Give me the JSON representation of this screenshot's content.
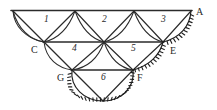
{
  "figure": {
    "type": "triangulation-survey-diagram",
    "background_color": "#ffffff",
    "ink_color": "#2b2b2b",
    "width": 217,
    "height": 110
  },
  "vertex_labels": [
    {
      "id": "A",
      "text": "A",
      "x": 196,
      "y": 7
    },
    {
      "id": "C",
      "text": "C",
      "x": 31,
      "y": 45
    },
    {
      "id": "E",
      "text": "E",
      "x": 170,
      "y": 46
    },
    {
      "id": "G",
      "text": "G",
      "x": 57,
      "y": 73
    },
    {
      "id": "F",
      "text": "F",
      "x": 137,
      "y": 73
    }
  ],
  "region_labels": [
    {
      "id": "1",
      "text": "1",
      "x": 44,
      "y": 15
    },
    {
      "id": "2",
      "text": "2",
      "x": 102,
      "y": 15
    },
    {
      "id": "3",
      "text": "3",
      "x": 161,
      "y": 15
    },
    {
      "id": "4",
      "text": "4",
      "x": 72,
      "y": 44
    },
    {
      "id": "5",
      "text": "5",
      "x": 131,
      "y": 44
    },
    {
      "id": "6",
      "text": "6",
      "x": 101,
      "y": 73
    }
  ],
  "nodes": {
    "top_left": {
      "x": 13,
      "y": 11
    },
    "top_mid1": {
      "x": 75,
      "y": 11
    },
    "top_mid2": {
      "x": 134,
      "y": 11
    },
    "top_right_A": {
      "x": 191,
      "y": 11
    },
    "mid_C": {
      "x": 44,
      "y": 42
    },
    "mid_center": {
      "x": 104,
      "y": 42
    },
    "mid_E": {
      "x": 163,
      "y": 42
    },
    "low_G": {
      "x": 72,
      "y": 70
    },
    "low_F": {
      "x": 133,
      "y": 70
    },
    "bottom_apex": {
      "x": 103,
      "y": 101
    }
  },
  "straight_segments": [
    {
      "name": "top-baseline",
      "from": "top_left",
      "to": "top_right_A"
    },
    {
      "name": "mid-baseline",
      "from": "mid_C",
      "to": "mid_E"
    },
    {
      "name": "low-baseline",
      "from": "low_G",
      "to": "low_F"
    },
    {
      "name": "topleft-to-C",
      "from": "top_left",
      "to": "mid_C"
    },
    {
      "name": "topmid1-to-C",
      "from": "top_mid1",
      "to": "mid_C"
    },
    {
      "name": "topmid1-to-center",
      "from": "top_mid1",
      "to": "mid_center"
    },
    {
      "name": "topmid2-to-center",
      "from": "top_mid2",
      "to": "mid_center"
    },
    {
      "name": "topmid2-to-E",
      "from": "top_mid2",
      "to": "mid_E"
    },
    {
      "name": "A-to-E",
      "from": "top_right_A",
      "to": "mid_E"
    },
    {
      "name": "C-to-G",
      "from": "mid_C",
      "to": "low_G"
    },
    {
      "name": "center-to-G",
      "from": "mid_center",
      "to": "low_G"
    },
    {
      "name": "center-to-F",
      "from": "mid_center",
      "to": "low_F"
    },
    {
      "name": "E-to-F",
      "from": "mid_E",
      "to": "low_F"
    },
    {
      "name": "G-to-apex",
      "from": "low_G",
      "to": "bottom_apex"
    },
    {
      "name": "F-to-apex",
      "from": "low_F",
      "to": "bottom_apex"
    }
  ],
  "arcs": [
    {
      "name": "arc-topleft-C",
      "note": "convex arc bulging left/down from top-left node to C"
    },
    {
      "name": "arc-topmid1-C",
      "note": "convex arc bulging down from top-mid1 to C"
    },
    {
      "name": "arc-topmid1-center",
      "note": "convex arc bulging down from top-mid1 to center"
    },
    {
      "name": "arc-topmid2-center",
      "note": "convex arc bulging down from top-mid2 to center"
    },
    {
      "name": "arc-topmid2-E",
      "note": "convex arc bulging down from top-mid2 to E"
    },
    {
      "name": "arc-C-G",
      "note": "convex arc bulging down from C to G"
    },
    {
      "name": "arc-center-G",
      "note": "convex arc bulging down from center to G"
    },
    {
      "name": "arc-center-F",
      "note": "convex arc bulging down from center to F"
    }
  ],
  "hachured_arcs": [
    {
      "name": "coast-A-to-E",
      "note": "hatched shoreline arc from A curving down-left to E, ticks on outer side"
    },
    {
      "name": "coast-E-to-F",
      "note": "hatched shoreline arc from E curving down-left to F, ticks on outer side"
    },
    {
      "name": "coast-G-to-apex-to-F",
      "note": "hatched shoreline arc sweeping below G through bottom apex up to F"
    }
  ]
}
